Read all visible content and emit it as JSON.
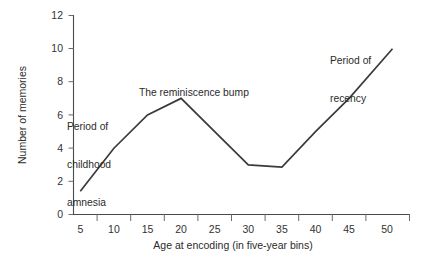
{
  "chart_data": {
    "type": "line",
    "title": "",
    "xlabel": "Age at encoding (in five-year bins)",
    "ylabel": "Number of memories",
    "x": [
      5,
      10,
      15,
      20,
      25,
      30,
      35,
      40,
      45,
      50
    ],
    "values": [
      1.4,
      4.0,
      6.0,
      7.0,
      5.0,
      3.0,
      2.85,
      5.0,
      7.0,
      10.0
    ],
    "series": [
      {
        "name": "Number of memories",
        "values": [
          1.4,
          4.0,
          6.0,
          7.0,
          5.0,
          3.0,
          2.85,
          5.0,
          7.0,
          10.0
        ]
      }
    ],
    "xtick_labels": [
      "5",
      "10",
      "15",
      "20",
      "25",
      "30",
      "35",
      "40",
      "45",
      "50"
    ],
    "ytick_labels": [
      "0",
      "2",
      "4",
      "6",
      "8",
      "10",
      "12"
    ],
    "ytick_values": [
      0,
      2,
      4,
      6,
      8,
      10,
      12
    ],
    "xlim": [
      2.5,
      52.5
    ],
    "ylim": [
      0,
      12
    ],
    "grid": false,
    "legend": false,
    "legend_position": "none",
    "line_color": "#3a3a3c",
    "axis_color": "#4a4a4a",
    "annotations": [
      {
        "id": "childhood-amnesia",
        "lines": [
          "Period of",
          "childhood",
          "amnesia"
        ],
        "text": "Period of childhood amnesia"
      },
      {
        "id": "reminiscence-bump",
        "lines": [
          "The reminiscence bump"
        ],
        "text": "The reminiscence bump"
      },
      {
        "id": "period-of-recency",
        "lines": [
          "Period of",
          "recency"
        ],
        "text": "Period of recency"
      }
    ]
  }
}
